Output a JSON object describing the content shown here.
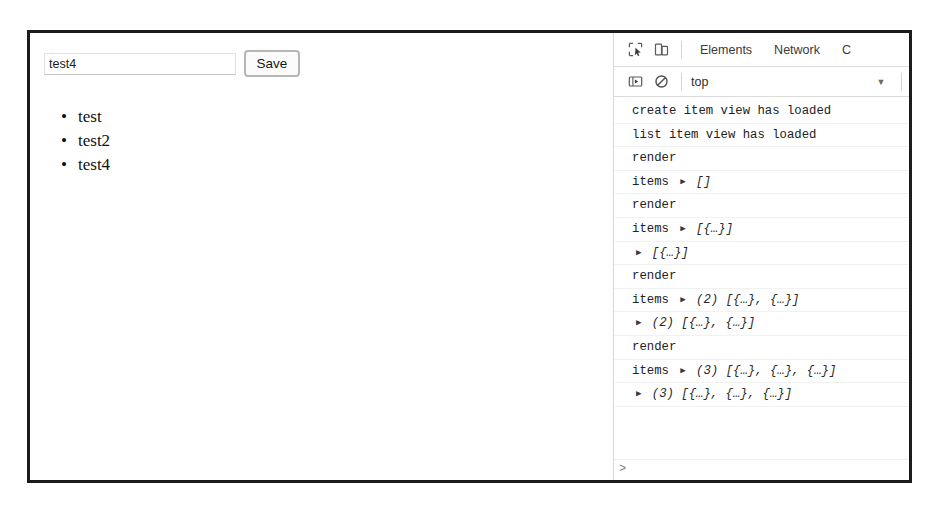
{
  "page": {
    "input": {
      "value": "test4",
      "placeholder": ""
    },
    "save_label": "Save",
    "items": [
      {
        "bullet": "•",
        "label": "test"
      },
      {
        "bullet": "•",
        "label": "test2"
      },
      {
        "bullet": "•",
        "label": "test4"
      }
    ]
  },
  "devtools": {
    "icons": {
      "inspect": "inspect-element-icon",
      "device": "device-toolbar-icon",
      "sidebar": "console-sidebar-icon",
      "clear": "clear-console-icon"
    },
    "tabs": [
      {
        "label": "Elements",
        "active": false
      },
      {
        "label": "Network",
        "active": false
      },
      {
        "label": "C",
        "active": true
      }
    ],
    "console_toolbar": {
      "context": "top",
      "caret": "▼"
    },
    "prompt": ">",
    "messages": [
      {
        "label": "create item view has loaded",
        "triangle": "",
        "value": ""
      },
      {
        "label": "list item view has loaded",
        "triangle": "",
        "value": ""
      },
      {
        "label": "render",
        "triangle": "",
        "value": ""
      },
      {
        "label": "items",
        "triangle": "▶",
        "value": "[]"
      },
      {
        "label": "render",
        "triangle": "",
        "value": ""
      },
      {
        "label": "items",
        "triangle": "▶",
        "value": "[{…}]"
      },
      {
        "label": "",
        "triangle": "▶",
        "value": "[{…}]"
      },
      {
        "label": "render",
        "triangle": "",
        "value": ""
      },
      {
        "label": "items",
        "triangle": "▶",
        "value": "(2) [{…}, {…}]"
      },
      {
        "label": "",
        "triangle": "▶",
        "value": "(2) [{…}, {…}]"
      },
      {
        "label": "render",
        "triangle": "",
        "value": ""
      },
      {
        "label": "items",
        "triangle": "▶",
        "value": "(3) [{…}, {…}, {…}]"
      },
      {
        "label": "",
        "triangle": "▶",
        "value": "(3) [{…}, {…}, {…}]"
      }
    ]
  },
  "colors": {
    "frame_border": "#1c1c1c",
    "panel_divider": "#d8d8d8",
    "text": "#222222",
    "muted": "#6a6a6a"
  }
}
